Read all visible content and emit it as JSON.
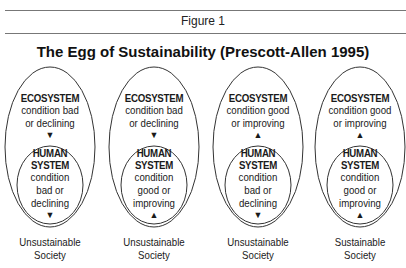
{
  "figure_label": "Figure 1",
  "title": "The Egg of Sustainability (Prescott-Allen 1995)",
  "eggs": [
    {
      "ecosystem": {
        "heading": "ECOSYSTEM",
        "line1": "condition bad",
        "line2": "or declining",
        "arrow": "▼"
      },
      "human": {
        "heading1": "HUMAN",
        "heading2": "SYSTEM",
        "line1": "condition",
        "line2": "bad or",
        "line3": "declining",
        "arrow": "▼"
      },
      "caption1": "Unsustainable",
      "caption2": "Society"
    },
    {
      "ecosystem": {
        "heading": "ECOSYSTEM",
        "line1": "condition bad",
        "line2": "or declining",
        "arrow": "▼"
      },
      "human": {
        "heading1": "HUMAN",
        "heading2": "SYSTEM",
        "line1": "condition",
        "line2": "good or",
        "line3": "improving",
        "arrow": "▲"
      },
      "caption1": "Unsustainable",
      "caption2": "Society"
    },
    {
      "ecosystem": {
        "heading": "ECOSYSTEM",
        "line1": "condition good",
        "line2": "or improving",
        "arrow": "▲"
      },
      "human": {
        "heading1": "HUMAN",
        "heading2": "SYSTEM",
        "line1": "condition",
        "line2": "bad or",
        "line3": "declining",
        "arrow": "▼"
      },
      "caption1": "Unsustainable",
      "caption2": "Society"
    },
    {
      "ecosystem": {
        "heading": "ECOSYSTEM",
        "line1": "condition good",
        "line2": "or improving",
        "arrow": "▲"
      },
      "human": {
        "heading1": "HUMAN",
        "heading2": "SYSTEM",
        "line1": "condition",
        "line2": "good or",
        "line3": "improving",
        "arrow": "▲"
      },
      "caption1": "Sustainable",
      "caption2": "Society"
    }
  ]
}
